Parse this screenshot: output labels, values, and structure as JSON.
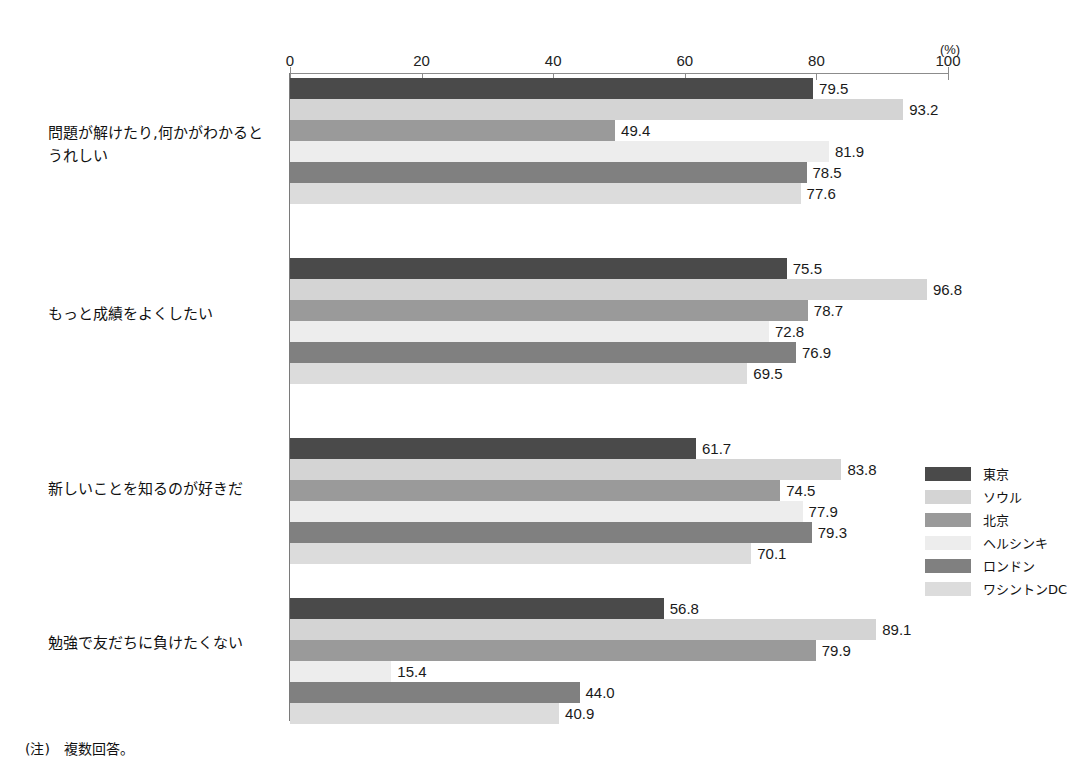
{
  "note": "(注)　複数回答。",
  "chart_data": {
    "type": "bar",
    "orientation": "horizontal",
    "title": "",
    "subtitle": "",
    "xlabel": "(%)",
    "ylabel": "",
    "xlim": [
      0,
      100
    ],
    "xticks": [
      0,
      20,
      40,
      60,
      80,
      100
    ],
    "xtick_labels": [
      "0",
      "20",
      "40",
      "60",
      "80",
      "100"
    ],
    "grid": false,
    "legend_position": "right",
    "unit_label": "(%)",
    "categories": [
      "問題が解けたり,何かがわかると\nうれしい",
      "もっと成績をよくしたい",
      "新しいことを知るのが好きだ",
      "勉強で友だちに負けたくない"
    ],
    "series": [
      {
        "name": "東京",
        "color": "#4a4a4a",
        "values": [
          79.5,
          75.5,
          61.7,
          56.8
        ]
      },
      {
        "name": "ソウル",
        "color": "#d4d4d4",
        "values": [
          93.2,
          96.8,
          83.8,
          89.1
        ]
      },
      {
        "name": "北京",
        "color": "#9a9a9a",
        "values": [
          49.4,
          78.7,
          74.5,
          79.9
        ]
      },
      {
        "name": "ヘルシンキ",
        "color": "#ededed",
        "values": [
          81.9,
          72.8,
          77.9,
          15.4
        ]
      },
      {
        "name": "ロンドン",
        "color": "#808080",
        "values": [
          78.5,
          76.9,
          79.3,
          44.0
        ]
      },
      {
        "name": "ワシントンDC",
        "color": "#dcdcdc",
        "values": [
          77.6,
          69.5,
          70.1,
          40.9
        ]
      }
    ],
    "value_labels": [
      [
        "79.5",
        "93.2",
        "49.4",
        "81.9",
        "78.5",
        "77.6"
      ],
      [
        "75.5",
        "96.8",
        "78.7",
        "72.8",
        "76.9",
        "69.5"
      ],
      [
        "61.7",
        "83.8",
        "74.5",
        "77.9",
        "79.3",
        "70.1"
      ],
      [
        "56.8",
        "89.1",
        "79.9",
        "15.4",
        "44.0",
        "40.9"
      ]
    ]
  }
}
